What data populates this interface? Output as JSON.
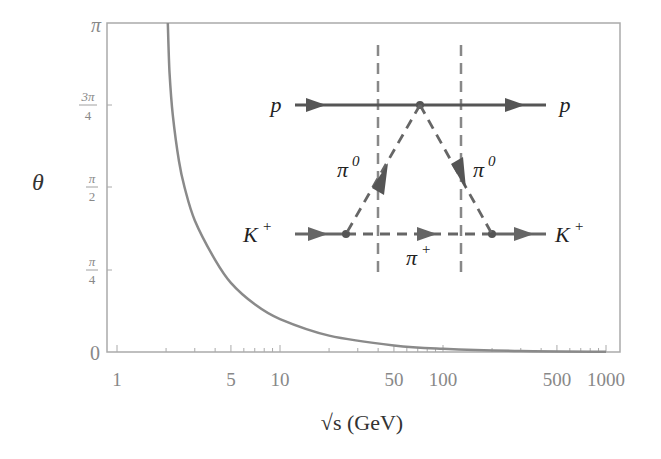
{
  "chart_data": {
    "type": "line",
    "title": "",
    "xlabel": "√s (GeV)",
    "ylabel": "θ",
    "xscale": "log",
    "xlim": [
      0.93,
      1200
    ],
    "ylim_label": [
      "0",
      "π"
    ],
    "ylim": [
      0,
      3.14159
    ],
    "grid": false,
    "legend": null,
    "x_ticks": [
      {
        "value": 1,
        "label": "1"
      },
      {
        "value": 5,
        "label": "5"
      },
      {
        "value": 10,
        "label": "10"
      },
      {
        "value": 50,
        "label": "50"
      },
      {
        "value": 100,
        "label": "100"
      },
      {
        "value": 500,
        "label": "500"
      },
      {
        "value": 1000,
        "label": "1000"
      }
    ],
    "y_ticks": [
      {
        "value": 0,
        "label": "0"
      },
      {
        "value": 0.7854,
        "label_num": "π",
        "label_den": "4"
      },
      {
        "value": 1.5708,
        "label_num": "π",
        "label_den": "2"
      },
      {
        "value": 2.3562,
        "label_num": "3π",
        "label_den": "4"
      },
      {
        "value": 3.14159,
        "label": "π"
      }
    ],
    "series": [
      {
        "name": "θ(√s)",
        "color": "#8a8a8a",
        "x": [
          2.05,
          2.1,
          2.2,
          2.4,
          2.6,
          3.0,
          4.0,
          5.0,
          7.0,
          10,
          20,
          50,
          100,
          300,
          1000
        ],
        "y_over_pi": [
          1.0,
          0.85,
          0.72,
          0.58,
          0.5,
          0.4,
          0.28,
          0.21,
          0.145,
          0.1,
          0.05,
          0.02,
          0.01,
          0.003,
          0.001
        ]
      }
    ],
    "inset_diagram": {
      "type": "feynman",
      "labels": {
        "p_in": "p",
        "p_out": "p",
        "k_in": "K",
        "k_in_sup": "+",
        "k_out": "K",
        "k_out_sup": "+",
        "pi0_left": "π",
        "pi0_left_sup": "0",
        "pi0_right": "π",
        "pi0_right_sup": "0",
        "pi_plus": "π",
        "pi_plus_sup": "+"
      },
      "lines": [
        {
          "from": "p_in",
          "to": "p_out",
          "style": "solid"
        },
        {
          "from": "k_in",
          "to": "k_out",
          "style": "solid+dashed (π⁺ exchange)"
        },
        {
          "from": "p_vertex",
          "to": "k_vertex_left",
          "style": "dashed",
          "particle": "π⁰"
        },
        {
          "from": "p_vertex",
          "to": "k_vertex_right",
          "style": "dashed",
          "particle": "π⁰"
        }
      ],
      "cuts": 2,
      "color": "#555555"
    }
  }
}
